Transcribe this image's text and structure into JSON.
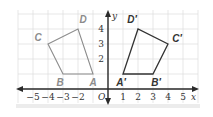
{
  "chart_data": {
    "type": "scatter",
    "title": "",
    "xlabel": "x",
    "ylabel": "y",
    "origin_label": "O",
    "xlim": [
      -5.9,
      6.0
    ],
    "ylim": [
      -0.9,
      5.2
    ],
    "x_ticks": [
      -5,
      -4,
      -3,
      -2,
      1,
      2,
      3,
      4,
      5
    ],
    "x_tick_labels": [
      "−5",
      "−4",
      "−3",
      "−2",
      "1",
      "2",
      "3",
      "4",
      "5"
    ],
    "y_ticks": [
      2,
      3,
      4
    ],
    "y_tick_labels": [
      "2",
      "3",
      "4"
    ],
    "grid": true,
    "shapes": [
      {
        "name": "ABCD",
        "color": "#8c8c8c",
        "label_color": "#8c8c8c",
        "vertices": [
          {
            "label": "A",
            "x": -1,
            "y": 1
          },
          {
            "label": "B",
            "x": -3,
            "y": 1
          },
          {
            "label": "C",
            "x": -4,
            "y": 3
          },
          {
            "label": "D",
            "x": -2,
            "y": 4
          }
        ]
      },
      {
        "name": "A'B'C'D'",
        "color": "#333333",
        "label_color": "#333333",
        "vertices": [
          {
            "label": "A′",
            "x": 1,
            "y": 1
          },
          {
            "label": "B′",
            "x": 3,
            "y": 1
          },
          {
            "label": "C′",
            "x": 4,
            "y": 3
          },
          {
            "label": "D′",
            "x": 2,
            "y": 4
          }
        ]
      }
    ]
  }
}
